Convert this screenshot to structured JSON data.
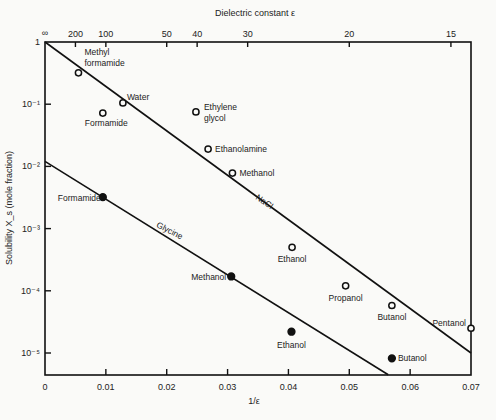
{
  "chart_data": {
    "type": "scatter",
    "title": "",
    "xlabel": "1/ε",
    "ylabel": "Solubility X_s (mole fraction)",
    "top_axis_label": "Dielectric constant ε",
    "xlim": [
      0,
      0.07
    ],
    "ylim_log10": [
      -5.35,
      0
    ],
    "yscale": "log",
    "grid": false,
    "legend": "none (series labelled inline)",
    "x_ticks": [
      "0",
      "0.01",
      "0.02",
      "0.03",
      "0.04",
      "0.05",
      "0.06",
      "0.07"
    ],
    "y_ticks": [
      "1",
      "10⁻¹",
      "10⁻²",
      "10⁻³",
      "10⁻⁴",
      "10⁻⁵"
    ],
    "top_ticks": [
      {
        "label": "∞",
        "x": 0
      },
      {
        "label": "200",
        "x": 0.005
      },
      {
        "label": "100",
        "x": 0.01
      },
      {
        "label": "50",
        "x": 0.02
      },
      {
        "label": "40",
        "x": 0.025
      },
      {
        "label": "30",
        "x": 0.0333
      },
      {
        "label": "20",
        "x": 0.05
      },
      {
        "label": "15",
        "x": 0.0667
      }
    ],
    "series": [
      {
        "name": "NaCl",
        "marker": "open-circle",
        "line": {
          "x": [
            0,
            0.07
          ],
          "log10y": [
            0,
            -5.0
          ]
        },
        "points": [
          {
            "label": "Methyl formamide",
            "x": 0.0055,
            "y": 0.32
          },
          {
            "label": "Formamide",
            "x": 0.0095,
            "y": 0.072
          },
          {
            "label": "Water",
            "x": 0.0128,
            "y": 0.105
          },
          {
            "label": "Ethylene glycol",
            "x": 0.0248,
            "y": 0.075
          },
          {
            "label": "Ethanolamine",
            "x": 0.0268,
            "y": 0.019
          },
          {
            "label": "Methanol",
            "x": 0.0308,
            "y": 0.0078
          },
          {
            "label": "Ethanol",
            "x": 0.0406,
            "y": 0.0005
          },
          {
            "label": "Propanol",
            "x": 0.0494,
            "y": 0.00012
          },
          {
            "label": "Butanol",
            "x": 0.057,
            "y": 5.8e-05
          },
          {
            "label": "Pentanol",
            "x": 0.07,
            "y": 2.5e-05
          }
        ]
      },
      {
        "name": "Glycine",
        "marker": "filled-circle",
        "line": {
          "x": [
            0,
            0.0564
          ],
          "log10y": [
            -1.92,
            -5.35
          ]
        },
        "points": [
          {
            "label": "Formamide",
            "x": 0.0095,
            "y": 0.0032
          },
          {
            "label": "Methanol",
            "x": 0.0306,
            "y": 0.00017
          },
          {
            "label": "Ethanol",
            "x": 0.0405,
            "y": 2.2e-05
          },
          {
            "label": "Butanol",
            "x": 0.057,
            "y": 8.2e-06
          }
        ]
      }
    ],
    "annotations": [
      "NaCl",
      "Glycine"
    ]
  }
}
